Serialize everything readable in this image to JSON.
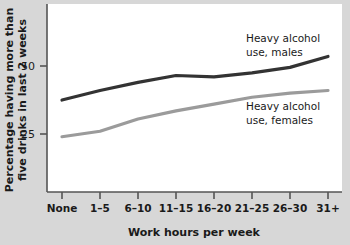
{
  "chart_data": {
    "type": "line",
    "title": "",
    "xlabel": "Work hours per week",
    "ylabel": "Percentage having more than five drinks in last 2 weeks",
    "ylabel_line1": "Percentage having more than",
    "ylabel_line2": "five drinks in last 2 weeks",
    "categories": [
      "None",
      "1–5",
      "6–10",
      "11–15",
      "16–20",
      "21–25",
      "26–30",
      "31+"
    ],
    "ytick_labels": [
      "25",
      "50"
    ],
    "yticks": [
      25,
      50
    ],
    "ylim": [
      0,
      70
    ],
    "grid": false,
    "legend_position": "inline-annotation",
    "series": [
      {
        "name": "Heavy alcohol use, males",
        "label_line1": "Heavy alcohol",
        "label_line2": "use, males",
        "color": "#333333",
        "values": [
          37.5,
          41.0,
          44.0,
          46.5,
          46.0,
          47.5,
          49.5,
          53.5
        ]
      },
      {
        "name": "Heavy alcohol use, females",
        "label_line1": "Heavy alcohol",
        "label_line2": "use, females",
        "color": "#9b9b9b",
        "values": [
          24.0,
          26.0,
          30.5,
          33.5,
          36.0,
          38.5,
          40.0,
          41.0
        ]
      }
    ]
  },
  "figure": {
    "background_color": "#d7d7d7",
    "plot_background_color": "#ffffff",
    "axis_color": "#555555"
  }
}
